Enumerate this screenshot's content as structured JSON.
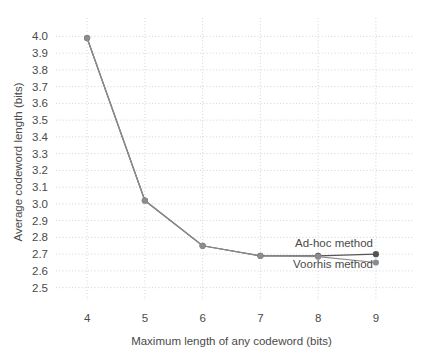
{
  "chart_data": {
    "type": "line",
    "title": "",
    "xlabel": "Maximum length of any codeword (bits)",
    "ylabel": "Average codeword length (bits)",
    "x": [
      4,
      5,
      6,
      7,
      8,
      9
    ],
    "xlim": [
      3.6,
      9.4
    ],
    "ylim": [
      2.45,
      4.05
    ],
    "xticks": [
      4,
      5,
      6,
      7,
      8,
      9
    ],
    "xtick_labels": [
      "4",
      "5",
      "6",
      "7",
      "8",
      "9"
    ],
    "yticks": [
      2.5,
      2.6,
      2.7,
      2.8,
      2.9,
      3.0,
      3.1,
      3.2,
      3.3,
      3.4,
      3.5,
      3.6,
      3.7,
      3.8,
      3.9,
      4.0
    ],
    "ytick_labels": [
      "2.5",
      "2.6",
      "2.7",
      "2.8",
      "2.9",
      "3.0",
      "3.1",
      "3.2",
      "3.3",
      "3.4",
      "3.5",
      "3.6",
      "3.7",
      "3.8",
      "3.9",
      "4.0"
    ],
    "grid": true,
    "legend_position": "inline-right",
    "series": [
      {
        "name": "Ad-hoc method",
        "color": "#545454",
        "marker": "circle",
        "values": [
          3.99,
          3.02,
          2.75,
          2.69,
          2.69,
          2.7
        ]
      },
      {
        "name": "Voorhis method",
        "color": "#8c8c8c",
        "marker": "circle",
        "values": [
          3.99,
          3.02,
          2.75,
          2.69,
          2.685,
          2.65
        ]
      }
    ],
    "annotations": [
      {
        "text": "Ad-hoc method",
        "x": 8.95,
        "y": 2.745,
        "anchor": "end"
      },
      {
        "text": "Voorhis method",
        "x": 8.95,
        "y": 2.615,
        "anchor": "end"
      }
    ]
  },
  "layout": {
    "plot_left": 64,
    "plot_right": 399,
    "plot_top": 28,
    "plot_bottom": 296
  }
}
